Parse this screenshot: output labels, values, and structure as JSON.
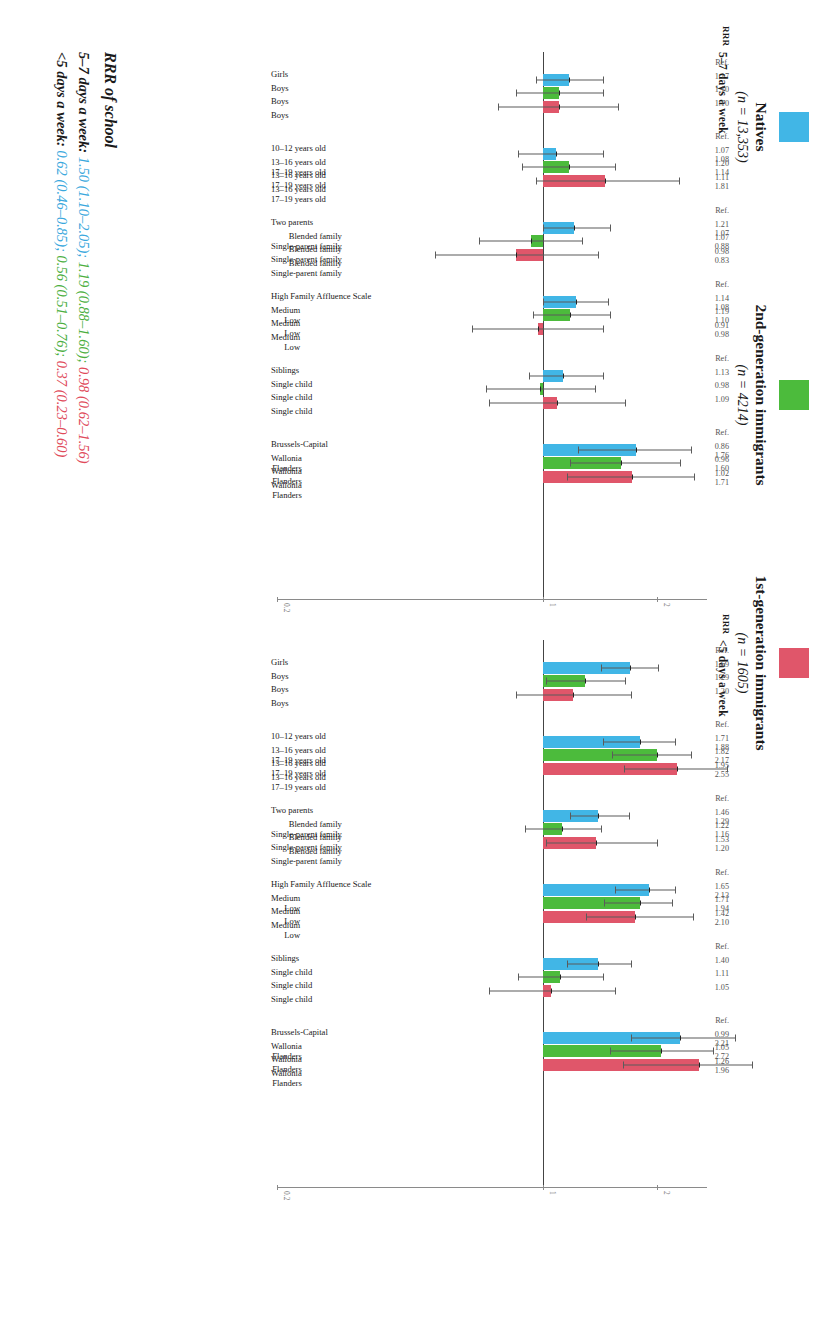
{
  "colors": {
    "natives": "#41b6e6",
    "second_gen": "#4cbb3c",
    "first_gen": "#e0566a",
    "axis": "#8a8a8a",
    "error": "#5b5b5b"
  },
  "legend": {
    "items": [
      {
        "label": "Natives",
        "n": "(n = 13,353)",
        "color_key": "natives"
      },
      {
        "label": "2nd-generation immigrants",
        "n": "(n = 4214)",
        "color_key": "second_gen"
      },
      {
        "label": "1st-generation immigrants",
        "n": "(n = 1605)",
        "color_key": "first_gen"
      }
    ]
  },
  "panels": [
    {
      "id": "A",
      "title": "5–7 days a week",
      "rrr_header": "RRR"
    },
    {
      "id": "B",
      "title": "<5 days a week",
      "rrr_header": "RRR"
    }
  ],
  "axis": {
    "ticks": [
      "0.2",
      "1",
      "2"
    ],
    "tick_values": [
      0.2,
      1,
      2
    ]
  },
  "caption": {
    "title": "RRR of school",
    "lines": [
      {
        "lead": "5–7 days a week:",
        "parts": [
          {
            "text": "1.50 (1.10–2.05);",
            "color_key": "natives"
          },
          {
            "text": "1.19 (0.88–1.60);",
            "color_key": "second_gen"
          },
          {
            "text": "0.98 (0.62–1.56)",
            "color_key": "first_gen"
          }
        ]
      },
      {
        "lead": "<5 days a week:",
        "parts": [
          {
            "text": "0.62 (0.46–0.85);",
            "color_key": "natives"
          },
          {
            "text": "0.56 (0.51–0.76);",
            "color_key": "second_gen"
          },
          {
            "text": "0.37 (0.23–0.60)",
            "color_key": "first_gen"
          }
        ]
      }
    ]
  },
  "chart_data": {
    "type": "bar",
    "ylabel": "RRR",
    "xlabel": "",
    "ylim": [
      0.2,
      2.6
    ],
    "log_scale": true,
    "grid": false,
    "legend_position": "top",
    "reference_line": 1,
    "series": [
      {
        "name": "Natives",
        "color": "#41b6e6"
      },
      {
        "name": "2nd-generation immigrants",
        "color": "#4cbb3c"
      },
      {
        "name": "1st-generation immigrants",
        "color": "#e0566a"
      }
    ],
    "groups": [
      {
        "name": "Sex",
        "categories": [
          "Girls",
          "Boys",
          "Boys",
          "Boys"
        ],
        "panels": {
          "5_7_days": [
            {
              "label": "Girls",
              "series": "reference",
              "rrr": "Ref.",
              "value": null,
              "lo": null,
              "hi": null
            },
            {
              "label": "Boys",
              "series": "natives",
              "rrr": "1.17",
              "value": 1.17,
              "lo": 0.96,
              "hi": 1.44
            },
            {
              "label": "Boys",
              "series": "second_gen",
              "rrr": "1.10",
              "value": 1.1,
              "lo": 0.85,
              "hi": 1.44
            },
            {
              "label": "Boys",
              "series": "first_gen",
              "rrr": "1.10",
              "value": 1.1,
              "lo": 0.76,
              "hi": 1.58
            }
          ],
          "lt_5_days": [
            {
              "label": "Girls",
              "series": "reference",
              "rrr": "Ref.",
              "value": null,
              "lo": null,
              "hi": null
            },
            {
              "label": "Boys",
              "series": "natives",
              "rrr": "1.69",
              "value": 1.69,
              "lo": 1.42,
              "hi": 2.01
            },
            {
              "label": "Boys",
              "series": "second_gen",
              "rrr": "1.29",
              "value": 1.29,
              "lo": 1.02,
              "hi": 1.64
            },
            {
              "label": "Boys",
              "series": "first_gen",
              "rrr": "1.20",
              "value": 1.2,
              "lo": 0.85,
              "hi": 1.7
            }
          ]
        }
      },
      {
        "name": "Age",
        "categories": [
          "10–12 years old",
          "13–16 years old / 17–19 years old"
        ],
        "panels": {
          "5_7_days": [
            {
              "label": "10–12 years old",
              "series": "reference",
              "rrr": "Ref.",
              "value": null,
              "lo": null,
              "hi": null
            },
            {
              "label": "13–16 years old\n17–19 years old",
              "series": "natives",
              "rrr": "1.07\n1.08",
              "value": 1.08,
              "lo": 0.86,
              "hi": 1.44
            },
            {
              "label": "13–16 years old\n17–19 years old",
              "series": "second_gen",
              "rrr": "1.20\n1.14",
              "value": 1.17,
              "lo": 0.88,
              "hi": 1.55
            },
            {
              "label": "13–16 years old\n17–19 years old",
              "series": "first_gen",
              "rrr": "1.11\n1.81",
              "value": 1.46,
              "lo": 0.96,
              "hi": 2.28
            }
          ],
          "lt_5_days": [
            {
              "label": "10–12 years old",
              "series": "reference",
              "rrr": "Ref.",
              "value": null,
              "lo": null,
              "hi": null
            },
            {
              "label": "13–16 years old\n17–19 years old",
              "series": "natives",
              "rrr": "1.71\n1.88",
              "value": 1.8,
              "lo": 1.44,
              "hi": 2.22
            },
            {
              "label": "13–16 years old\n17–19 years old",
              "series": "second_gen",
              "rrr": "1.82\n2.17",
              "value": 2.0,
              "lo": 1.52,
              "hi": 2.45
            },
            {
              "label": "13–16 years old\n17–19 years old",
              "series": "first_gen",
              "rrr": "1.95\n2.55",
              "value": 2.25,
              "lo": 1.63,
              "hi": 3.05
            }
          ]
        }
      },
      {
        "name": "Family structure",
        "categories": [
          "Two parents",
          "Blended family / Single-parent family"
        ],
        "panels": {
          "5_7_days": [
            {
              "label": "Two parents",
              "series": "reference",
              "rrr": "Ref.",
              "value": null,
              "lo": null,
              "hi": null
            },
            {
              "label": "Blended family\nSingle-parent family",
              "series": "natives",
              "rrr": "1.21\n1.07",
              "value": 1.21,
              "lo": 1.0,
              "hi": 1.5
            },
            {
              "label": "Blended family\nSingle-parent family",
              "series": "second_gen",
              "rrr": "1.07\n0.88",
              "value": 0.93,
              "lo": 0.68,
              "hi": 1.27
            },
            {
              "label": "Blended family\nSingle-parent family",
              "series": "first_gen",
              "rrr": "0.98\n0.83",
              "value": 0.85,
              "lo": 0.52,
              "hi": 1.4
            }
          ],
          "lt_5_days": [
            {
              "label": "Two parents",
              "series": "reference",
              "rrr": "Ref.",
              "value": null,
              "lo": null,
              "hi": null
            },
            {
              "label": "Blended family\nSingle-parent family",
              "series": "natives",
              "rrr": "1.46\n1.29",
              "value": 1.4,
              "lo": 1.18,
              "hi": 1.68
            },
            {
              "label": "Blended family\nSingle-parent family",
              "series": "second_gen",
              "rrr": "1.22\n1.16",
              "value": 1.12,
              "lo": 0.9,
              "hi": 1.42
            },
            {
              "label": "Blended family\nSingle-parent family",
              "series": "first_gen",
              "rrr": "1.53\n1.20",
              "value": 1.38,
              "lo": 1.02,
              "hi": 2.0
            }
          ]
        }
      },
      {
        "name": "Family Affluence Scale",
        "categories": [
          "High Family Affluence Scale",
          "Medium / Low"
        ],
        "panels": {
          "5_7_days": [
            {
              "label": "High Family Affluence Scale",
              "series": "reference",
              "rrr": "Ref.",
              "value": null,
              "lo": null,
              "hi": null
            },
            {
              "label": "Medium\nLow",
              "series": "natives",
              "rrr": "1.14\n1.08",
              "value": 1.22,
              "lo": 1.0,
              "hi": 1.48
            },
            {
              "label": "Medium\nLow",
              "series": "second_gen",
              "rrr": "1.19\n1.10",
              "value": 1.18,
              "lo": 0.94,
              "hi": 1.5
            },
            {
              "label": "Medium\nLow",
              "series": "first_gen",
              "rrr": "0.91\n0.98",
              "value": 0.97,
              "lo": 0.65,
              "hi": 1.44
            }
          ],
          "lt_5_days": [
            {
              "label": "High Family Affluence Scale",
              "series": "reference",
              "rrr": "Ref.",
              "value": null,
              "lo": null,
              "hi": null
            },
            {
              "label": "Medium\nLow",
              "series": "natives",
              "rrr": "1.65\n2.13",
              "value": 1.9,
              "lo": 1.55,
              "hi": 2.22
            },
            {
              "label": "Medium\nLow",
              "series": "second_gen",
              "rrr": "1.71\n1.94",
              "value": 1.8,
              "lo": 1.45,
              "hi": 2.18
            },
            {
              "label": "Medium\nLow",
              "series": "first_gen",
              "rrr": "1.42\n2.10",
              "value": 1.75,
              "lo": 1.3,
              "hi": 2.48
            }
          ]
        }
      },
      {
        "name": "Siblings",
        "categories": [
          "Siblings",
          "Single child"
        ],
        "panels": {
          "5_7_days": [
            {
              "label": "Siblings",
              "series": "reference",
              "rrr": "Ref.",
              "value": null,
              "lo": null,
              "hi": null
            },
            {
              "label": "Single child",
              "series": "natives",
              "rrr": "1.13",
              "value": 1.13,
              "lo": 0.92,
              "hi": 1.44
            },
            {
              "label": "Single child",
              "series": "second_gen",
              "rrr": "0.98",
              "value": 0.98,
              "lo": 0.71,
              "hi": 1.37
            },
            {
              "label": "Single child",
              "series": "first_gen",
              "rrr": "1.09",
              "value": 1.09,
              "lo": 0.72,
              "hi": 1.64
            }
          ],
          "lt_5_days": [
            {
              "label": "Siblings",
              "series": "reference",
              "rrr": "Ref.",
              "value": null,
              "lo": null,
              "hi": null
            },
            {
              "label": "Single child",
              "series": "natives",
              "rrr": "1.40",
              "value": 1.4,
              "lo": 1.16,
              "hi": 1.7
            },
            {
              "label": "Single child",
              "series": "second_gen",
              "rrr": "1.11",
              "value": 1.11,
              "lo": 0.86,
              "hi": 1.44
            },
            {
              "label": "Single child",
              "series": "first_gen",
              "rrr": "1.05",
              "value": 1.05,
              "lo": 0.72,
              "hi": 1.55
            }
          ]
        }
      },
      {
        "name": "Region",
        "categories": [
          "Brussels-Capital",
          "Wallonia / Flanders"
        ],
        "panels": {
          "5_7_days": [
            {
              "label": "Brussels-Capital",
              "series": "reference",
              "rrr": "Ref.",
              "value": null,
              "lo": null,
              "hi": null
            },
            {
              "label": "Wallonia\nFlanders",
              "series": "natives",
              "rrr": "0.86\n1.76",
              "value": 1.76,
              "lo": 1.24,
              "hi": 2.45
            },
            {
              "label": "Wallonia\nFlanders",
              "series": "second_gen",
              "rrr": "0.96\n1.60",
              "value": 1.6,
              "lo": 1.18,
              "hi": 2.3
            },
            {
              "label": "Wallonia\nFlanders",
              "series": "first_gen",
              "rrr": "1.02\n1.71",
              "value": 1.72,
              "lo": 1.16,
              "hi": 2.5
            }
          ],
          "lt_5_days": [
            {
              "label": "Brussels-Capital",
              "series": "reference",
              "rrr": "Ref.",
              "value": null,
              "lo": null,
              "hi": null
            },
            {
              "label": "Wallonia\nFlanders",
              "series": "natives",
              "rrr": "0.99\n3.21",
              "value": 2.3,
              "lo": 1.7,
              "hi": 3.2
            },
            {
              "label": "Wallonia\nFlanders",
              "series": "second_gen",
              "rrr": "1.05\n2.72",
              "value": 2.05,
              "lo": 1.5,
              "hi": 2.8
            },
            {
              "label": "Wallonia\nFlanders",
              "series": "first_gen",
              "rrr": "1.26\n1.96",
              "value": 2.58,
              "lo": 1.62,
              "hi": 3.55
            }
          ]
        }
      }
    ]
  }
}
